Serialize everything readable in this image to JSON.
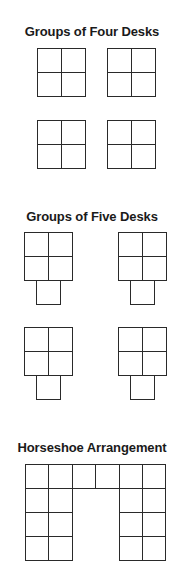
{
  "sections": [
    {
      "id": "four",
      "title": "Groups of Four Desks",
      "title_top": 24
    },
    {
      "id": "five",
      "title": "Groups of Five Desks",
      "title_top": 209
    },
    {
      "id": "horseshoe",
      "title": "Horseshoe Arrangement",
      "title_top": 440
    }
  ],
  "desk_size": 24,
  "groups": [
    {
      "section": "four",
      "name": "four-desk-group-1",
      "origin": [
        37,
        48
      ],
      "cells": [
        [
          0,
          0
        ],
        [
          1,
          0
        ],
        [
          0,
          1
        ],
        [
          1,
          1
        ]
      ]
    },
    {
      "section": "four",
      "name": "four-desk-group-2",
      "origin": [
        107,
        48
      ],
      "cells": [
        [
          0,
          0
        ],
        [
          1,
          0
        ],
        [
          0,
          1
        ],
        [
          1,
          1
        ]
      ]
    },
    {
      "section": "four",
      "name": "four-desk-group-3",
      "origin": [
        37,
        120
      ],
      "cells": [
        [
          0,
          0
        ],
        [
          1,
          0
        ],
        [
          0,
          1
        ],
        [
          1,
          1
        ]
      ]
    },
    {
      "section": "four",
      "name": "four-desk-group-4",
      "origin": [
        107,
        120
      ],
      "cells": [
        [
          0,
          0
        ],
        [
          1,
          0
        ],
        [
          0,
          1
        ],
        [
          1,
          1
        ]
      ]
    },
    {
      "section": "five",
      "name": "five-desk-group-1",
      "origin": [
        24,
        232
      ],
      "cells": [
        [
          0,
          0
        ],
        [
          1,
          0
        ],
        [
          0,
          1
        ],
        [
          1,
          1
        ],
        [
          0.5,
          2
        ]
      ]
    },
    {
      "section": "five",
      "name": "five-desk-group-2",
      "origin": [
        118,
        232
      ],
      "cells": [
        [
          0,
          0
        ],
        [
          1,
          0
        ],
        [
          0,
          1
        ],
        [
          1,
          1
        ],
        [
          0.5,
          2
        ]
      ]
    },
    {
      "section": "five",
      "name": "five-desk-group-3",
      "origin": [
        24,
        327
      ],
      "cells": [
        [
          0,
          0
        ],
        [
          1,
          0
        ],
        [
          0,
          1
        ],
        [
          1,
          1
        ],
        [
          0.5,
          2
        ]
      ]
    },
    {
      "section": "five",
      "name": "five-desk-group-4",
      "origin": [
        118,
        327
      ],
      "cells": [
        [
          0,
          0
        ],
        [
          1,
          0
        ],
        [
          0,
          1
        ],
        [
          1,
          1
        ],
        [
          0.5,
          2
        ]
      ]
    },
    {
      "section": "horseshoe",
      "name": "horseshoe-group",
      "origin": [
        25,
        464
      ],
      "cell_w": 23.4,
      "cell_h": 24,
      "cells": [
        [
          0,
          0
        ],
        [
          1,
          0
        ],
        [
          2,
          0
        ],
        [
          3,
          0
        ],
        [
          4,
          0
        ],
        [
          5,
          0
        ],
        [
          0,
          1
        ],
        [
          1,
          1
        ],
        [
          4,
          1
        ],
        [
          5,
          1
        ],
        [
          0,
          2
        ],
        [
          1,
          2
        ],
        [
          4,
          2
        ],
        [
          5,
          2
        ],
        [
          0,
          3
        ],
        [
          1,
          3
        ],
        [
          4,
          3
        ],
        [
          5,
          3
        ]
      ]
    }
  ],
  "colors": {
    "line": "#2a2a2a",
    "text": "#1a1a1a",
    "background": "#ffffff"
  }
}
